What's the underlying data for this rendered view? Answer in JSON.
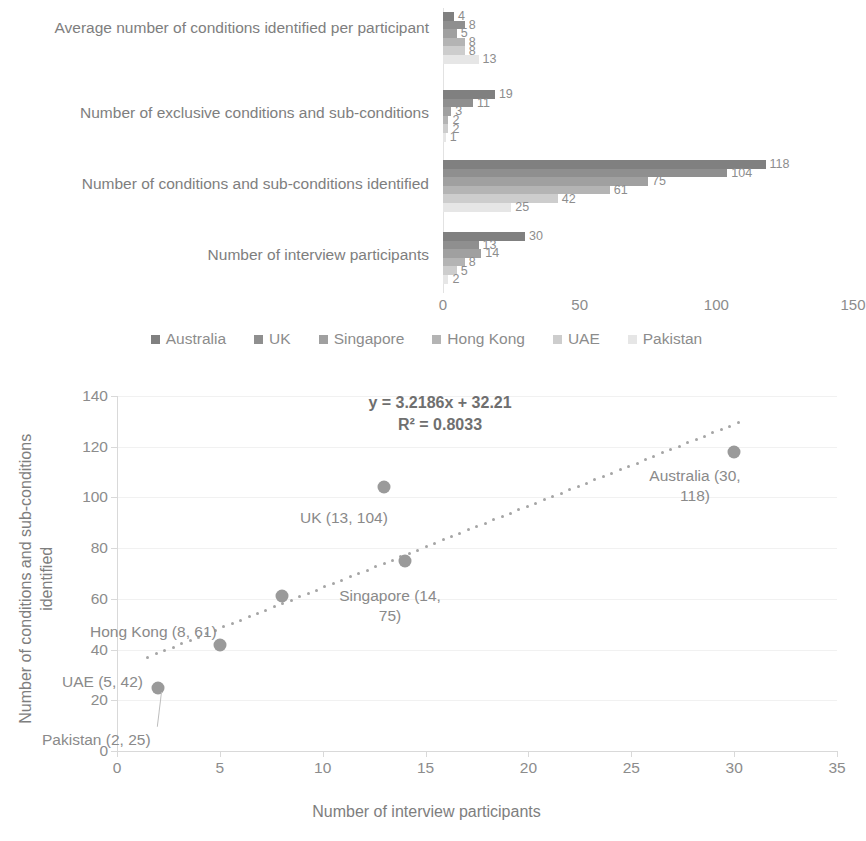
{
  "bar_chart": {
    "categories": [
      "Average number of conditions identified per participant",
      "Number of exclusive conditions and sub-conditions",
      "Number of conditions and sub-conditions identified",
      "Number of interview participants"
    ],
    "series": [
      {
        "name": "Australia",
        "color": "#808080",
        "values": [
          4,
          19,
          118,
          30
        ]
      },
      {
        "name": "UK",
        "color": "#8f8f8f",
        "values": [
          8,
          11,
          104,
          13
        ]
      },
      {
        "name": "Singapore",
        "color": "#a0a0a0",
        "values": [
          5,
          3,
          75,
          14
        ]
      },
      {
        "name": "Hong Kong",
        "color": "#b4b4b4",
        "values": [
          8,
          2,
          61,
          8
        ]
      },
      {
        "name": "UAE",
        "color": "#cdcdcd",
        "values": [
          8,
          2,
          42,
          5
        ]
      },
      {
        "name": "Pakistan",
        "color": "#e6e6e6",
        "values": [
          13,
          1,
          25,
          2
        ]
      }
    ],
    "x_ticks": [
      "0",
      "50",
      "100",
      "150"
    ],
    "x_max": 150,
    "legend_position": "bottom"
  },
  "chart_data": [
    {
      "type": "bar",
      "title": "",
      "orientation": "horizontal",
      "categories": [
        "Average number of conditions identified per participant",
        "Number of exclusive conditions and sub-conditions",
        "Number of conditions and sub-conditions identified",
        "Number of interview participants"
      ],
      "series": [
        {
          "name": "Australia",
          "values": [
            4,
            19,
            118,
            30
          ]
        },
        {
          "name": "UK",
          "values": [
            8,
            11,
            104,
            13
          ]
        },
        {
          "name": "Singapore",
          "values": [
            5,
            3,
            75,
            14
          ]
        },
        {
          "name": "Hong Kong",
          "values": [
            8,
            2,
            61,
            8
          ]
        },
        {
          "name": "UAE",
          "values": [
            8,
            2,
            42,
            5
          ]
        },
        {
          "name": "Pakistan",
          "values": [
            13,
            1,
            25,
            2
          ]
        }
      ],
      "xlabel": "",
      "ylabel": "",
      "xlim": [
        0,
        150
      ],
      "xticks": [
        0,
        50,
        100,
        150
      ],
      "grid": false,
      "legend": "bottom"
    },
    {
      "type": "scatter",
      "title": "",
      "xlabel": "Number of interview participants",
      "ylabel": "Number of conditions and sub-conditions identified",
      "xlim": [
        0,
        35
      ],
      "ylim": [
        0,
        140
      ],
      "xticks": [
        0,
        5,
        10,
        15,
        20,
        25,
        30,
        35
      ],
      "yticks": [
        0,
        20,
        40,
        60,
        80,
        100,
        120,
        140
      ],
      "grid": true,
      "points": [
        {
          "label": "Pakistan",
          "x": 2,
          "y": 25
        },
        {
          "label": "UAE",
          "x": 5,
          "y": 42
        },
        {
          "label": "Hong Kong",
          "x": 8,
          "y": 61
        },
        {
          "label": "UK",
          "x": 13,
          "y": 104
        },
        {
          "label": "Singapore",
          "x": 14,
          "y": 75
        },
        {
          "label": "Australia",
          "x": 30,
          "y": 118
        }
      ],
      "trendline": {
        "equation": "y = 3.2186x + 32.21",
        "r_squared": "R² = 0.8033",
        "slope": 3.2186,
        "intercept": 32.21,
        "style": "dotted"
      }
    }
  ],
  "scatter_chart": {
    "equation": "y = 3.2186x + 32.21",
    "r_squared_text": "R² = 0.8033",
    "x_title": "Number of interview participants",
    "y_title": "Number of conditions and sub-conditions identified",
    "x_ticks": [
      "0",
      "5",
      "10",
      "15",
      "20",
      "25",
      "30",
      "35"
    ],
    "y_ticks": [
      "0",
      "20",
      "40",
      "60",
      "80",
      "100",
      "120",
      "140"
    ],
    "point_labels": {
      "pakistan": "Pakistan (2, 25)",
      "uae": "UAE (5, 42)",
      "hong_kong": "Hong Kong (8, 61)",
      "uk": "UK (13, 104)",
      "singapore": "Singapore (14,\n75)",
      "australia": "Australia (30,\n118)"
    }
  }
}
